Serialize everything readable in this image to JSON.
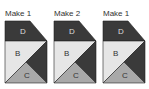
{
  "blocks": [
    {
      "label": "Make 1",
      "pieces": {
        "top": "D",
        "left": "B",
        "bottom": "C"
      }
    },
    {
      "label": "Make 2",
      "pieces": {
        "top": "D",
        "left": "B",
        "bottom": "C"
      }
    },
    {
      "label": "Make 1",
      "pieces": {
        "top": "D",
        "left": "B",
        "bottom": "C"
      }
    }
  ],
  "colors": {
    "dark": "#3a3a3a",
    "light": "#e6e6e6",
    "medium": "#a9a9a9",
    "outline": "#222222",
    "text_on_dark": "#dddddd",
    "text_on_light": "#333333"
  }
}
